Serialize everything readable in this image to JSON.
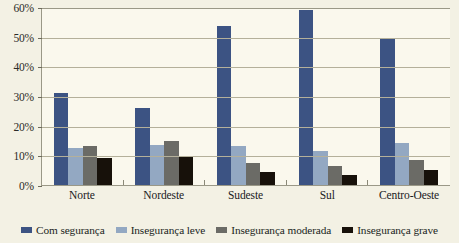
{
  "chart_data": {
    "type": "bar",
    "title": "",
    "subtitle": "",
    "xlabel": "",
    "ylabel": "",
    "ylim": [
      0,
      60
    ],
    "ytick_labels": [
      "0%",
      "10%",
      "20%",
      "30%",
      "40%",
      "50%",
      "60%"
    ],
    "ytick_values": [
      0,
      10,
      20,
      30,
      40,
      50,
      60
    ],
    "grid": true,
    "legend_position": "bottom",
    "categories": [
      "Norte",
      "Nordeste",
      "Sudeste",
      "Sul",
      "Centro-Oeste"
    ],
    "series": [
      {
        "name": "Com segurança",
        "color": "#3c5383",
        "values": [
          31.0,
          26.0,
          53.5,
          59.0,
          49.5
        ]
      },
      {
        "name": "Insegurança leve",
        "color": "#93a8c2",
        "values": [
          12.5,
          13.5,
          13.0,
          11.5,
          14.0
        ]
      },
      {
        "name": "Insegurança moderada",
        "color": "#6b6b66",
        "values": [
          13.0,
          15.0,
          7.5,
          6.5,
          8.5
        ]
      },
      {
        "name": "Insegurança grave",
        "color": "#17110a",
        "values": [
          9.0,
          9.5,
          4.5,
          3.5,
          5.0
        ]
      }
    ]
  },
  "colors": {
    "page_background": "#f3f1e4",
    "plot_background": "#faf8ed",
    "gridline": "#b4b09a",
    "axis": "#9a9887",
    "text": "#20201d"
  }
}
